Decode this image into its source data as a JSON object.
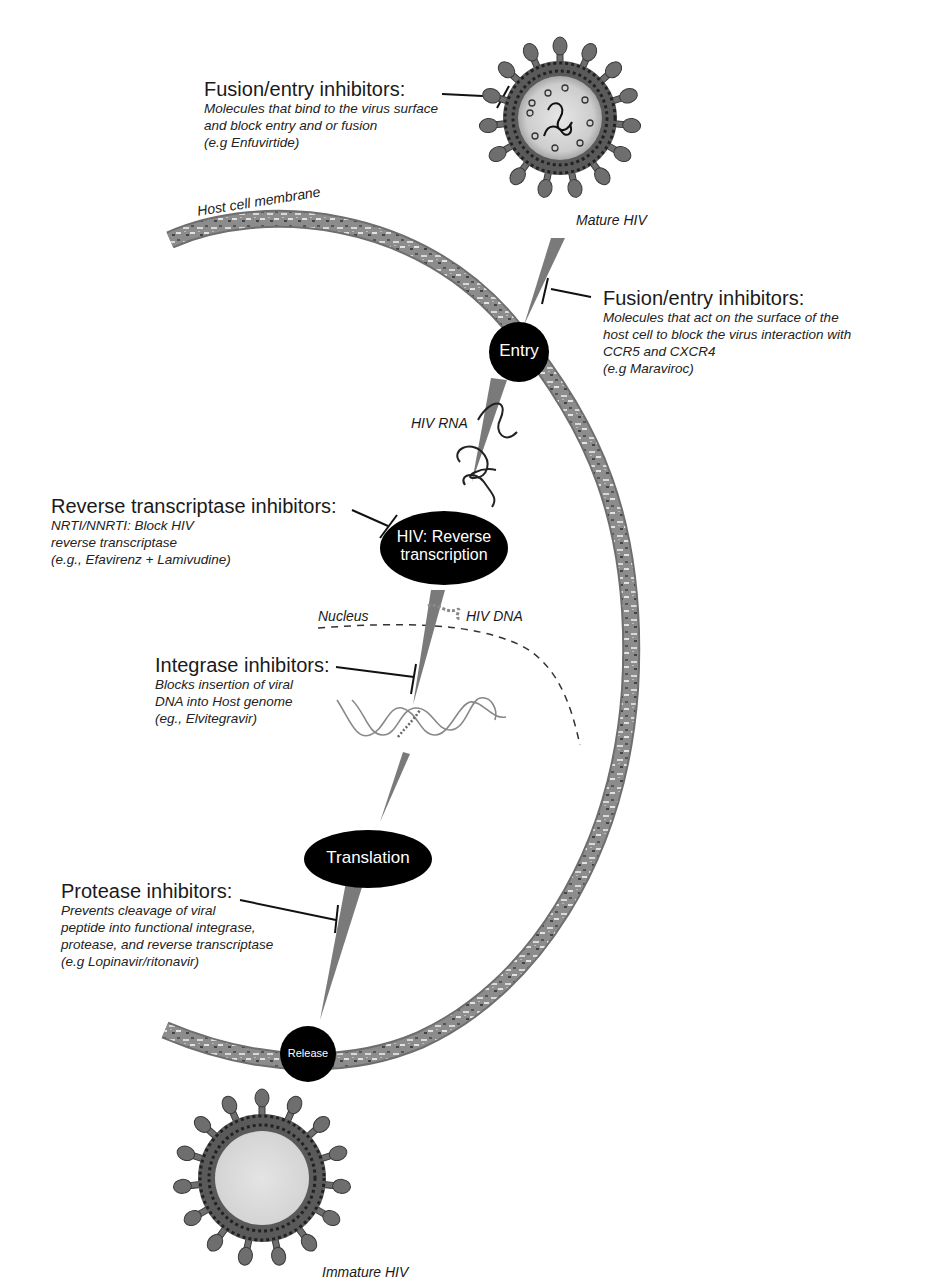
{
  "diagram": {
    "colors": {
      "membrane": "#8a8a8a",
      "node_fill": "#000000",
      "arrow": "#7a7a7a",
      "virus_core": "#cfcfcf",
      "virus_spike": "#6e6e6e",
      "text": "#1a1a1a"
    },
    "labels": {
      "host_membrane": "Host cell membrane",
      "mature_hiv": "Mature HIV",
      "immature_hiv": "Immature HIV",
      "hiv_rna": "HIV RNA",
      "hiv_dna": "HIV DNA",
      "nucleus": "Nucleus"
    },
    "nodes": [
      {
        "id": "entry",
        "label_lines": [
          "Entry"
        ]
      },
      {
        "id": "reverse-transcription",
        "label_lines": [
          "HIV: Reverse",
          "transcription"
        ]
      },
      {
        "id": "translation",
        "label_lines": [
          "Translation"
        ]
      },
      {
        "id": "release",
        "label_lines": [
          "Release"
        ]
      }
    ],
    "inhibitors": [
      {
        "id": "fusion-entry-virus",
        "title": "Fusion/entry inhibitors:",
        "description": [
          "Molecules that bind to the virus surface",
          "and block entry and or fusion",
          "(e.g Enfuvirtide)"
        ]
      },
      {
        "id": "fusion-entry-host",
        "title": "Fusion/entry inhibitors:",
        "description": [
          "Molecules that act on the surface of the",
          "host cell to block the virus interaction with",
          "CCR5 and CXCR4",
          "(e.g Maraviroc)"
        ]
      },
      {
        "id": "reverse-transcriptase",
        "title": "Reverse transcriptase inhibitors:",
        "description": [
          "NRTI/NNRTI: Block HIV",
          "reverse transcriptase",
          "(e.g., Efavirenz + Lamivudine)"
        ]
      },
      {
        "id": "integrase",
        "title": "Integrase inhibitors:",
        "description": [
          "Blocks insertion of viral",
          "DNA into Host genome",
          "(eg., Elvitegravir)"
        ]
      },
      {
        "id": "protease",
        "title": "Protease inhibitors:",
        "description": [
          "Prevents cleavage of viral",
          "peptide into functional integrase,",
          "protease, and reverse transcriptase",
          "(e.g Lopinavir/ritonavir)"
        ]
      }
    ]
  }
}
